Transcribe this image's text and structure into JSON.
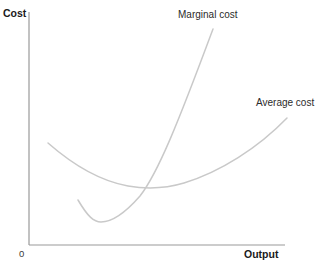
{
  "chart_data": {
    "type": "line",
    "title": "",
    "subtitle": "",
    "xlabel": "Output",
    "ylabel": "Cost",
    "origin_label": "0",
    "grid": false,
    "legend_position": "inline-annotations",
    "axis_color": "#999999",
    "curve_color": "#c9c9c9",
    "background_color": "#ffffff",
    "xlim": [
      0,
      1
    ],
    "ylim": [
      0,
      1
    ],
    "axis_ticks": {
      "x": [],
      "y": []
    },
    "annotations": [
      {
        "text": "Marginal cost",
        "x": 0.582,
        "y": 0.905
      },
      {
        "text": "Average cost",
        "x": 0.886,
        "y": 0.627
      }
    ],
    "series": [
      {
        "name": "Marginal cost",
        "label": "Marginal cost",
        "color": "#c9c9c9",
        "shape": "u-shaped-steep",
        "minimum": {
          "x": 0.277,
          "y": 0.098
        },
        "path": "M 78 200 C 88 217, 94 222, 101 222 C 112 222, 126 212, 140 196 C 158 173, 178 123, 213 29",
        "points": [
          {
            "x": 0.191,
            "y": 0.193
          },
          {
            "x": 0.277,
            "y": 0.098
          },
          {
            "x": 0.434,
            "y": 0.244
          },
          {
            "x": 0.492,
            "y": 0.352
          },
          {
            "x": 0.719,
            "y": 0.927
          }
        ]
      },
      {
        "name": "Average cost",
        "label": "Average cost",
        "color": "#c9c9c9",
        "shape": "u-shaped-shallow",
        "minimum": {
          "x": 0.492,
          "y": 0.244
        },
        "path": "M 48 143 C 72 164, 100 181, 128 186 C 146 189, 164 189, 184 183 C 220 172, 258 148, 287 118",
        "points": [
          {
            "x": 0.074,
            "y": 0.438
          },
          {
            "x": 0.387,
            "y": 0.253
          },
          {
            "x": 0.492,
            "y": 0.244
          },
          {
            "x": 0.605,
            "y": 0.266
          },
          {
            "x": 1.007,
            "y": 0.545
          }
        ]
      }
    ],
    "axes_geometry": {
      "y_axis": {
        "x": 29,
        "y_top": 12,
        "y_bottom": 245
      },
      "x_axis": {
        "y": 245,
        "x_left": 29,
        "x_right": 285
      }
    }
  }
}
